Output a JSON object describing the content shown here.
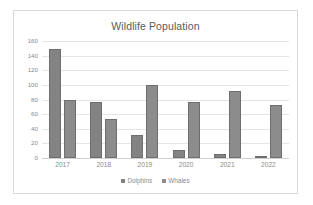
{
  "chart_data": {
    "type": "bar",
    "title": "Wildlife Population",
    "xlabel": "",
    "ylabel": "",
    "categories": [
      "2017",
      "2018",
      "2019",
      "2020",
      "2021",
      "2022"
    ],
    "series": [
      {
        "name": "Dolphins",
        "color": "#838383",
        "values": [
          149,
          77,
          32,
          11,
          5,
          1
        ]
      },
      {
        "name": "Whales",
        "color": "#8c8c8c",
        "values": [
          80,
          54,
          100,
          77,
          92,
          72
        ]
      }
    ],
    "ylim": [
      0,
      160
    ],
    "yticks": [
      0,
      20,
      40,
      60,
      80,
      100,
      120,
      140,
      160
    ],
    "ytick_labels": [
      "0",
      "20",
      "40",
      "60",
      "80",
      "100",
      "120",
      "140",
      "160"
    ],
    "grid": true,
    "legend_position": "bottom"
  },
  "legend": {
    "entries": [
      {
        "label": "Dolphins"
      },
      {
        "label": "Whales"
      }
    ]
  },
  "colors": {
    "bar_primary": "#838383",
    "bar_secondary": "#8c8c8c",
    "gridline": "#e4e4e4",
    "text": "#8a8a8a",
    "title_text": "#5a5a5a",
    "frame_border": "#d9d9d9",
    "background": "#ffffff"
  }
}
